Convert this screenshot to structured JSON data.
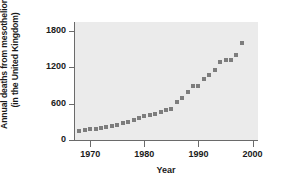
{
  "chart_data": {
    "type": "scatter",
    "title": "",
    "xlabel": "Year",
    "ylabel_line1": "Annual deaths from mesothelioma",
    "ylabel_line2": "(in the United Kingdom)",
    "xlim": [
      1967,
      2001
    ],
    "ylim": [
      0,
      1950
    ],
    "grid": false,
    "legend": null,
    "marker": "square",
    "marker_color": "#7d7d7d",
    "panel_background": "#ebebeb",
    "axis_color": "#6a6a6a",
    "xticks": [
      1970,
      1980,
      1990,
      2000
    ],
    "xtick_labels": [
      "1970",
      "1980",
      "1990",
      "2000"
    ],
    "yticks": [
      0,
      600,
      1200,
      1800
    ],
    "ytick_labels": [
      "0",
      "600",
      "1200",
      "1800"
    ],
    "x": [
      1968,
      1969,
      1970,
      1971,
      1972,
      1973,
      1974,
      1975,
      1976,
      1977,
      1978,
      1979,
      1980,
      1981,
      1982,
      1983,
      1984,
      1985,
      1986,
      1987,
      1988,
      1989,
      1990,
      1991,
      1992,
      1993,
      1994,
      1995,
      1996,
      1997,
      1998
    ],
    "values": [
      153,
      160,
      175,
      190,
      200,
      215,
      235,
      255,
      275,
      300,
      330,
      360,
      390,
      420,
      430,
      470,
      490,
      520,
      620,
      700,
      800,
      900,
      900,
      1000,
      1080,
      1160,
      1290,
      1330,
      1330,
      1400,
      1600
    ]
  },
  "axis": {
    "x_title": "Year",
    "y_title_line1": "Annual deaths from mesothelioma",
    "y_title_line2": "(in the United Kingdom)"
  }
}
